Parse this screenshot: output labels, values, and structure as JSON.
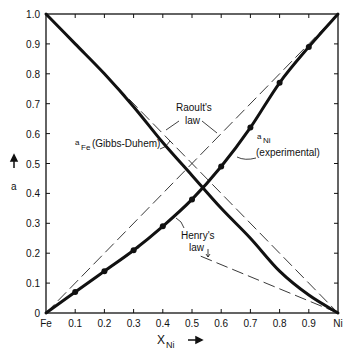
{
  "chart_data": {
    "type": "line",
    "title": "",
    "xlabel": "X_Ni",
    "xlabel_main": "X",
    "xlabel_sub": "Ni",
    "ylabel": "a",
    "xlim": [
      0,
      1
    ],
    "ylim": [
      0,
      1
    ],
    "grid": false,
    "x_tick_labels": [
      "Fe",
      "0.1",
      "0.2",
      "0.3",
      "0.4",
      "0.5",
      "0.6",
      "0.7",
      "0.8",
      "0.9",
      "Ni"
    ],
    "y_tick_labels": [
      "0",
      "0.1",
      "0.2",
      "0.3",
      "0.4",
      "0.5",
      "0.6",
      "0.7",
      "0.8",
      "0.9",
      "1.0"
    ],
    "series": [
      {
        "name": "a_Ni (experimental)",
        "style": "thick solid with markers",
        "x": [
          0,
          0.1,
          0.2,
          0.3,
          0.4,
          0.5,
          0.6,
          0.7,
          0.8,
          0.9,
          1.0
        ],
        "values": [
          0,
          0.07,
          0.14,
          0.21,
          0.29,
          0.38,
          0.49,
          0.62,
          0.77,
          0.89,
          1.0
        ]
      },
      {
        "name": "a_Fe (Gibbs-Duhem)",
        "style": "thick solid",
        "x": [
          0,
          0.1,
          0.2,
          0.3,
          0.4,
          0.5,
          0.6,
          0.7,
          0.8,
          0.9,
          1.0
        ],
        "values": [
          1.0,
          0.9,
          0.8,
          0.69,
          0.57,
          0.46,
          0.35,
          0.25,
          0.14,
          0.06,
          0
        ]
      },
      {
        "name": "Raoult's law (Ni)",
        "style": "long dash",
        "x": [
          0,
          1
        ],
        "values": [
          0,
          1
        ]
      },
      {
        "name": "Raoult's law (Fe)",
        "style": "long dash",
        "x": [
          0,
          1
        ],
        "values": [
          1,
          0
        ]
      },
      {
        "name": "Henry's law (Ni)",
        "style": "thin dash",
        "x": [
          0,
          0.32
        ],
        "values": [
          0,
          0.22
        ]
      },
      {
        "name": "Henry's law (Fe)",
        "style": "long dash",
        "x": [
          0.53,
          1.0
        ],
        "values": [
          0.19,
          0
        ]
      }
    ],
    "annotations": [
      {
        "text": "Raoult's law",
        "line1": "Raoult's",
        "line2": "law"
      },
      {
        "text": "a_Fe(Gibbs-Duhem)",
        "main": "a",
        "sub": "Fe",
        "rest": "(Gibbs-Duhem)"
      },
      {
        "text": "a_Ni (experimental)",
        "main": "a",
        "sub": "Ni",
        "line2": "(experimental)"
      },
      {
        "text": "Henry's law",
        "line1": "Henry's",
        "line2": "law"
      }
    ]
  }
}
